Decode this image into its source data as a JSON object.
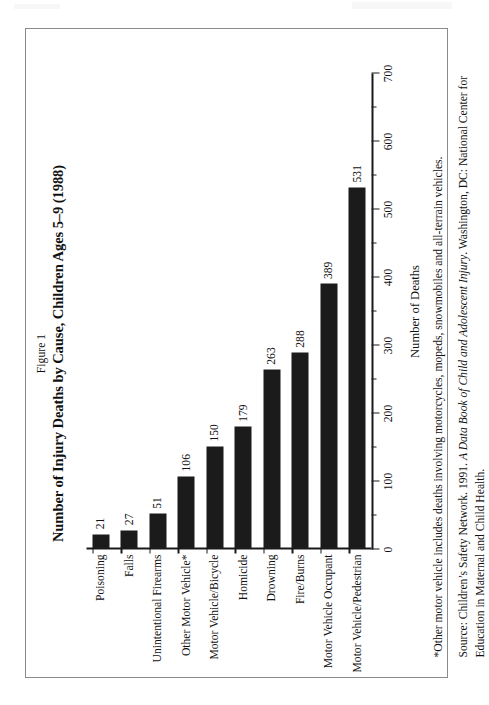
{
  "figure": {
    "label": "Figure 1",
    "title": "Number of Injury Deaths by Cause, Children Ages 5–9 (1988)"
  },
  "notes": {
    "footnote_marker": "*",
    "footnote": "*Other motor vehicle includes deaths involving motorcycles, mopeds, snowmobiles and all-terrain vehicles.",
    "source_prefix": "Source: Children’s Safety Network. 1991. ",
    "source_italic": "A Data Book of Child and Adolescent Injury",
    "source_suffix": ". Washington, DC: National Center for Education in Maternal and Child Health."
  },
  "chart_data": {
    "type": "bar",
    "orientation": "vertical-rotated",
    "title": "Number of Injury Deaths by Cause, Children Ages 5–9 (1988)",
    "xlabel": "",
    "ylabel": "Number of Deaths",
    "ylim": [
      0,
      700
    ],
    "grid": false,
    "legend": false,
    "tick_step": 100,
    "minor_tick_step": 50,
    "categories": [
      "Poisoning",
      "Falls",
      "Unintentional Firearms",
      "Other Motor Vehicle*",
      "Motor Vehicle/Bicycle",
      "Homicide",
      "Drowning",
      "Fire/Burns",
      "Motor Vehicle Occupant",
      "Motor Vehicle/Pedestrian"
    ],
    "values": [
      21,
      27,
      51,
      106,
      150,
      179,
      263,
      288,
      389,
      531
    ],
    "value_labels": [
      "21",
      "27",
      "51",
      "106",
      "150",
      "179",
      "263",
      "288",
      "389",
      "531"
    ],
    "tick_labels": [
      "0",
      "100",
      "200",
      "300",
      "400",
      "500",
      "600",
      "700"
    ],
    "tick_values": [
      0,
      100,
      200,
      300,
      400,
      500,
      600,
      700
    ],
    "bar_color": "#1b1b1b",
    "axis_color": "#1a1a1a",
    "background": "#ffffff"
  }
}
